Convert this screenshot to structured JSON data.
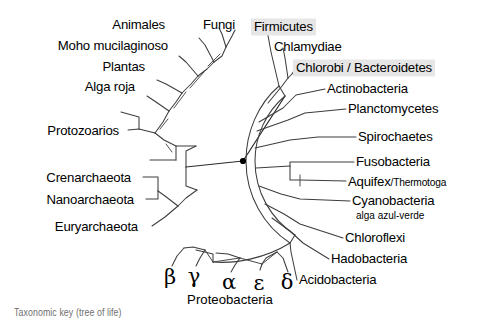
{
  "figure": {
    "title": "Taxonomic key (tree of life)",
    "caption": "Taxonomic key (tree of life)",
    "background_color": "#ffffff",
    "line_color": "#3d3d3d",
    "text_color": "#000000",
    "highlight_color": "#e6e6e6",
    "root_marker_color": "#000000"
  },
  "tree": {
    "type": "radial-phylogram",
    "root": {
      "x": 243,
      "y": 161,
      "label": ""
    },
    "domains": [
      {
        "name": "Eukaryota",
        "sector": "upper-left"
      },
      {
        "name": "Archaea",
        "sector": "lower-left"
      },
      {
        "name": "Bacteria",
        "sector": "right"
      }
    ]
  },
  "labels": {
    "eukaryotes": [
      {
        "id": "animales",
        "text": "Animales",
        "x": 165,
        "y": 25,
        "align": "l"
      },
      {
        "id": "fungi",
        "text": "Fungi",
        "x": 203,
        "y": 25,
        "align": "r"
      },
      {
        "id": "moho-mucilaginoso",
        "text": "Moho mucilaginoso",
        "x": 168,
        "y": 45,
        "align": "l"
      },
      {
        "id": "plantas",
        "text": "Plantas",
        "x": 145,
        "y": 66,
        "align": "l"
      },
      {
        "id": "alga-roja",
        "text": "Alga roja",
        "x": 135,
        "y": 86,
        "align": "l"
      },
      {
        "id": "protozoarios",
        "text": "Protozoarios",
        "x": 119,
        "y": 131,
        "align": "l"
      }
    ],
    "archaea": [
      {
        "id": "crenarchaeota",
        "text": "Crenarchaeota",
        "x": 131,
        "y": 177,
        "align": "l"
      },
      {
        "id": "nanoarchaeota",
        "text": "Nanoarchaeota",
        "x": 134,
        "y": 199,
        "align": "l"
      },
      {
        "id": "euryarchaeota",
        "text": "Euryarchaeota",
        "x": 138,
        "y": 226,
        "align": "l"
      }
    ],
    "bacteria": [
      {
        "id": "firmicutes",
        "text": "Firmicutes",
        "x": 251,
        "y": 27,
        "align": "r",
        "highlight": true
      },
      {
        "id": "chlamydiae",
        "text": "Chlamydiae",
        "x": 274,
        "y": 46,
        "align": "r",
        "highlight": false
      },
      {
        "id": "chlorobi-bacteroidetes",
        "text": "Chlorobi / Bacteroidetes",
        "x": 293,
        "y": 67,
        "align": "r",
        "highlight": true
      },
      {
        "id": "actinobacteria",
        "text": "Actinobacteria",
        "x": 327,
        "y": 88,
        "align": "r",
        "highlight": false
      },
      {
        "id": "planctomycetes",
        "text": "Planctomycetes",
        "x": 348,
        "y": 108,
        "align": "r",
        "highlight": false
      },
      {
        "id": "spirochaetes",
        "text": "Spirochaetes",
        "x": 358,
        "y": 136,
        "align": "r",
        "highlight": false
      },
      {
        "id": "fusobacteria",
        "text": "Fusobacteria",
        "x": 356,
        "y": 161,
        "align": "r",
        "highlight": false
      },
      {
        "id": "aquifex-thermotoga",
        "text": "Aquifex",
        "text_small": "/Thermotoga",
        "x": 348,
        "y": 181,
        "align": "r",
        "highlight": false
      },
      {
        "id": "cyanobacteria",
        "text": "Cyanobacteria",
        "sub": "alga azul-verde",
        "x": 352,
        "y": 200,
        "sub_x": 356,
        "sub_y": 215,
        "align": "r",
        "highlight": false
      },
      {
        "id": "chloroflexi",
        "text": "Chloroflexi",
        "x": 345,
        "y": 237,
        "align": "r",
        "highlight": false
      },
      {
        "id": "hadobacteria",
        "text": "Hadobacteria",
        "x": 331,
        "y": 258,
        "align": "r",
        "highlight": false
      },
      {
        "id": "acidobacteria",
        "text": "Acidobacteria",
        "x": 299,
        "y": 279,
        "align": "r",
        "highlight": false
      }
    ],
    "proteobacteria": {
      "group_label": "Proteobacteria",
      "group_x": 230,
      "group_y": 297,
      "members": [
        {
          "id": "beta",
          "symbol": "β",
          "x": 170,
          "y": 275
        },
        {
          "id": "gamma",
          "symbol": "γ",
          "x": 194,
          "y": 274
        },
        {
          "id": "alpha",
          "symbol": "α",
          "x": 229,
          "y": 280
        },
        {
          "id": "epsilon",
          "symbol": "ε",
          "x": 259,
          "y": 281
        },
        {
          "id": "delta",
          "symbol": "δ",
          "x": 287,
          "y": 280
        }
      ]
    }
  }
}
